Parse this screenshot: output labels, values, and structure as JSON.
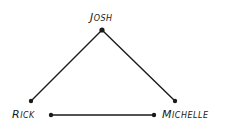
{
  "diagram": {
    "type": "network-graph",
    "nodes": [
      {
        "id": "josh",
        "label": "Josh",
        "x": 102,
        "y": 30
      },
      {
        "id": "rick",
        "label": "Rick",
        "x": 51,
        "y": 115
      },
      {
        "id": "michelle",
        "label": "Michelle",
        "x": 154,
        "y": 115
      }
    ],
    "edges": [
      {
        "from": "josh",
        "to": "rick",
        "x1": 102,
        "y1": 30,
        "x2": 31,
        "y2": 101
      },
      {
        "from": "josh",
        "to": "michelle",
        "x1": 102,
        "y1": 30,
        "x2": 175,
        "y2": 101
      },
      {
        "from": "rick",
        "to": "michelle",
        "x1": 51,
        "y1": 115,
        "x2": 154,
        "y2": 115
      }
    ],
    "endpoints": [
      {
        "x": 102,
        "y": 30
      },
      {
        "x": 31,
        "y": 101
      },
      {
        "x": 175,
        "y": 101
      },
      {
        "x": 51,
        "y": 115
      },
      {
        "x": 154,
        "y": 115
      }
    ],
    "colors": {
      "line": "#1a1a1a",
      "background": "#ffffff"
    }
  }
}
